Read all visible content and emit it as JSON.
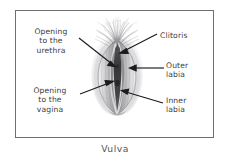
{
  "figure": {
    "caption": "Vulva",
    "frame_color": "#6f6f72",
    "background_color": "#ffffff",
    "text_color": "#3a3a3c",
    "illustration_name": "vulva-anatomical-illustration"
  },
  "labels": {
    "urethra": "Opening\nto the\nurethra",
    "vagina": "Opening\nto the\nvagina",
    "clitoris": "Clitoris",
    "outer_labia": "Outer\nlabia",
    "inner_labia": "Inner\nlabia"
  }
}
